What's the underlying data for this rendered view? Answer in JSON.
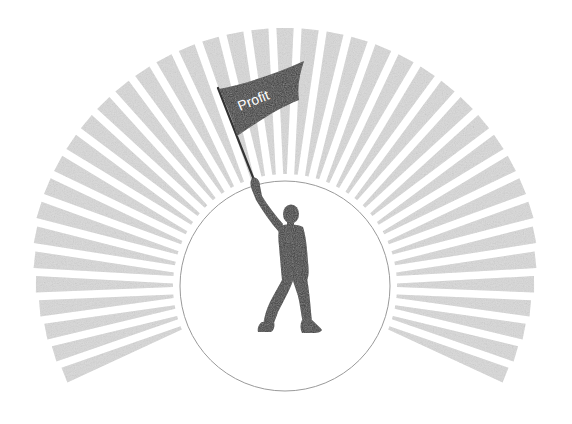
{
  "illustration": {
    "subject": "person-raising-flag",
    "flag": {
      "label": "Profit",
      "color": "#3b3b3b",
      "text_color": "#ffffff"
    },
    "figure": {
      "color": "#3a3a3a"
    },
    "spotlight_circle": {
      "center": [
        285,
        286
      ],
      "radius": 105,
      "fill": "#ffffff",
      "stroke": "#9a9a9a"
    },
    "sunburst": {
      "ray_count": 41,
      "start_angle_deg": -22,
      "end_angle_deg": 202,
      "inner_radius": 112,
      "outer_radius": 258,
      "color": "#d9d9d9"
    }
  }
}
